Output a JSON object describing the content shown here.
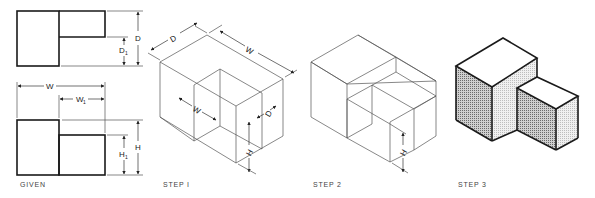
{
  "figure": {
    "panels": [
      {
        "id": "given",
        "caption": "GIVEN"
      },
      {
        "id": "step1",
        "caption": "STEP I"
      },
      {
        "id": "step2",
        "caption": "STEP 2"
      },
      {
        "id": "step3",
        "caption": "STEP 3"
      }
    ],
    "dimensions": {
      "W": "W",
      "W1": "W",
      "W1_sub": "1",
      "D": "D",
      "D1": "D",
      "D1_sub": "1",
      "H": "H",
      "H1": "H",
      "H1_sub": "1"
    },
    "colors": {
      "line": "#1a1a1a",
      "construction": "#555555",
      "shade_dark": "#9a9a9a",
      "shade_light": "#d8d8d8"
    }
  }
}
